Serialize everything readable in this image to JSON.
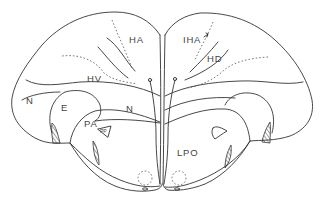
{
  "diagram": {
    "type": "anatomical cross-section (line drawing)",
    "labels": {
      "ha": "HA",
      "iha": "IHA",
      "hd": "HD",
      "hv": "HV",
      "n_left": "N",
      "n_center": "N",
      "e": "E",
      "pa": "PA",
      "pp": "PP",
      "lpo": "LPO"
    },
    "colors": {
      "line": "#333333",
      "text": "#444444",
      "background": "#ffffff"
    }
  }
}
